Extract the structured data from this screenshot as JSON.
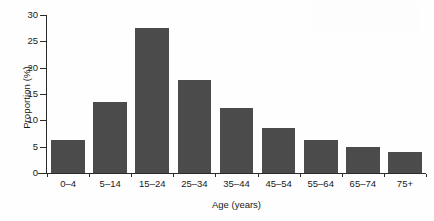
{
  "chart_data": {
    "type": "bar",
    "title": "",
    "subtitle": "",
    "xlabel": "Age (years)",
    "ylabel": "Proportion (%)",
    "categories": [
      "0–4",
      "5–14",
      "15–24",
      "25–34",
      "35–44",
      "45–54",
      "55–64",
      "65–74",
      "75+"
    ],
    "values": [
      6.3,
      13.4,
      27.6,
      17.6,
      12.3,
      8.5,
      6.3,
      5.0,
      3.9
    ],
    "series": [
      {
        "name": "Proportion",
        "values": [
          6.3,
          13.4,
          27.6,
          17.6,
          12.3,
          8.5,
          6.3,
          5.0,
          3.9
        ]
      }
    ],
    "ylim": [
      0,
      30
    ],
    "yticks": [
      0,
      5,
      10,
      15,
      20,
      25,
      30
    ],
    "ytick_labels": [
      "0",
      "5",
      "10",
      "15",
      "20",
      "25",
      "30"
    ],
    "grid": false,
    "legend": false,
    "legend_position": "none",
    "bar_color": "#4b4b4b",
    "axis_color": "#2b2b2b",
    "background_color": "#ffffff",
    "text_color": "#1a1a1a"
  },
  "axes": {
    "y_title": "Proportion (%)",
    "x_title": "Age (years)"
  }
}
